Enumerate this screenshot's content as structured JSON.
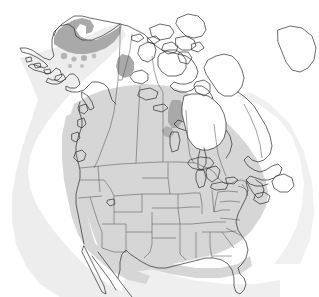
{
  "figure": {
    "type": "range-map",
    "region": "North America",
    "projection": "conic",
    "background_color": "#ffffff",
    "width": 319,
    "height": 297
  },
  "legend_colors": {
    "range_primary": "#d6d6d6",
    "range_secondary": "#a9a9a9",
    "halo_shadow": "#ededed",
    "land_fill": "#ffffff",
    "water_fill": "#ffffff",
    "coastline_stroke": "#2b2b2b",
    "admin_boundary_stroke": "#555555"
  },
  "layers": [
    {
      "name": "halo-shadow",
      "fill": "#ededed",
      "description": "soft grey halo offset to lower-left of landmass"
    },
    {
      "name": "range-primary",
      "fill": "#d6d6d6",
      "description": "light grey primary range across contiguous United States and southern Canada"
    },
    {
      "name": "range-secondary",
      "fill": "#a9a9a9",
      "description": "darker grey secondary patches in northern Alaska, Mackenzie Delta and west Hudson Bay"
    },
    {
      "name": "landmass-outline",
      "fill": "#ffffff",
      "stroke": "#2b2b2b",
      "description": "coastline of North America including Canadian Arctic Archipelago"
    },
    {
      "name": "admin-boundaries",
      "stroke": "#555555",
      "description": "United States state lines and Canadian provincial/territorial lines"
    }
  ],
  "features": {
    "countries": [
      "Canada",
      "United States",
      "Mexico",
      "Greenland"
    ],
    "water_bodies": [
      "Hudson Bay",
      "Great Lakes",
      "Gulf of Mexico",
      "Great Slave Lake",
      "Great Bear Lake",
      "Lake Winnipeg"
    ],
    "notable_regions": [
      "Alaska North Slope",
      "Canadian Arctic Archipelago",
      "Baja California",
      "Florida Peninsula",
      "Labrador",
      "Newfoundland",
      "Aleutian Islands"
    ]
  },
  "annotations": {
    "visible_text": "",
    "labels": [],
    "scale_bar": "",
    "north_arrow": ""
  }
}
